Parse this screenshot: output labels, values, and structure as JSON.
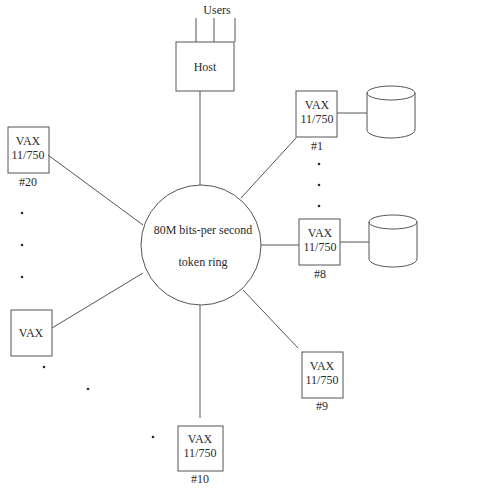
{
  "diagram": {
    "users_label": "Users",
    "host_label": "Host",
    "ring": {
      "line1": "80M bits-per second",
      "line2": "token ring"
    },
    "nodes": {
      "n1": {
        "line1": "VAX",
        "line2": "11/750",
        "id": "#1"
      },
      "n8": {
        "line1": "VAX",
        "line2": "11/750",
        "id": "#8"
      },
      "n9": {
        "line1": "VAX",
        "line2": "11/750",
        "id": "#9"
      },
      "n10": {
        "line1": "VAX",
        "line2": "11/750",
        "id": "#10"
      },
      "n20": {
        "line1": "VAX",
        "line2": "11/750",
        "id": "#20"
      },
      "nvax": {
        "line1": "VAX"
      }
    },
    "ellipsis_dot": "•"
  },
  "colors": {
    "line": "#555555",
    "text": "#2a2a2a",
    "background": "#ffffff"
  }
}
